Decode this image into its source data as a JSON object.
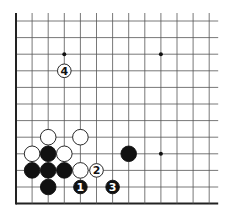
{
  "diagram": {
    "type": "go-board-fragment",
    "grid": {
      "columns": 13,
      "rows": 12,
      "x_start": 16,
      "x_step": 16.1,
      "y_start": 21,
      "y_step": 16.6,
      "left_edge": true,
      "bottom_edge": true,
      "line_color": "#555555",
      "edge_color": "#222222"
    },
    "star_points": [
      {
        "col": 3,
        "row": 2
      },
      {
        "col": 9,
        "row": 2
      },
      {
        "col": 9,
        "row": 8
      }
    ],
    "stones": [
      {
        "color": "white",
        "col": 2,
        "row": 7,
        "label": ""
      },
      {
        "color": "white",
        "col": 4,
        "row": 7,
        "label": ""
      },
      {
        "color": "white",
        "col": 1,
        "row": 8,
        "label": ""
      },
      {
        "color": "black",
        "col": 2,
        "row": 8,
        "label": ""
      },
      {
        "color": "white",
        "col": 3,
        "row": 8,
        "label": ""
      },
      {
        "color": "black",
        "col": 7,
        "row": 8,
        "label": ""
      },
      {
        "color": "black",
        "col": 1,
        "row": 9,
        "label": ""
      },
      {
        "color": "black",
        "col": 2,
        "row": 9,
        "label": ""
      },
      {
        "color": "black",
        "col": 3,
        "row": 9,
        "label": ""
      },
      {
        "color": "white",
        "col": 4,
        "row": 9,
        "label": ""
      },
      {
        "color": "white",
        "col": 5,
        "row": 9,
        "label": "2",
        "small": true
      },
      {
        "color": "black",
        "col": 2,
        "row": 10,
        "label": ""
      },
      {
        "color": "black",
        "col": 4,
        "row": 10,
        "label": "1",
        "small": true
      },
      {
        "color": "black",
        "col": 6,
        "row": 10,
        "label": "3",
        "small": true
      },
      {
        "color": "white",
        "col": 3,
        "row": 3,
        "label": "4",
        "small": true
      }
    ]
  }
}
